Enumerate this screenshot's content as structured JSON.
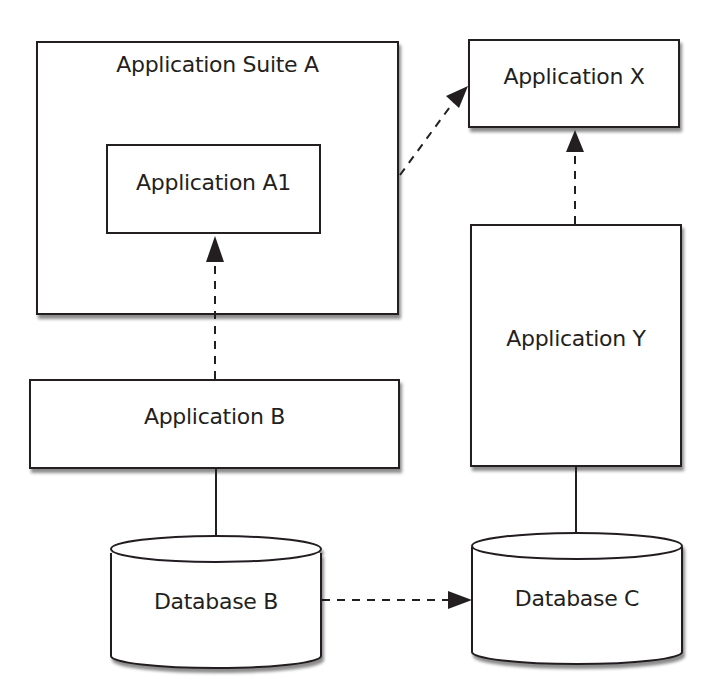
{
  "diagram": {
    "nodes": {
      "suite_a": {
        "label": "Application Suite A",
        "type": "container"
      },
      "app_a1": {
        "label": "Application A1",
        "type": "application"
      },
      "app_x": {
        "label": "Application X",
        "type": "application"
      },
      "app_y": {
        "label": "Application Y",
        "type": "application"
      },
      "app_b": {
        "label": "Application B",
        "type": "application"
      },
      "db_b": {
        "label": "Database B",
        "type": "database"
      },
      "db_c": {
        "label": "Database C",
        "type": "database"
      }
    },
    "edges": [
      {
        "from": "Application B",
        "to": "Application A1",
        "style": "dashed",
        "arrow": true
      },
      {
        "from": "Application Suite A",
        "to": "Application X",
        "style": "dashed",
        "arrow": true
      },
      {
        "from": "Application Y",
        "to": "Application X",
        "style": "dashed",
        "arrow": true
      },
      {
        "from": "Database B",
        "to": "Database C",
        "style": "dashed",
        "arrow": true
      },
      {
        "from": "Application B",
        "to": "Database B",
        "style": "solid",
        "arrow": false
      },
      {
        "from": "Application Y",
        "to": "Database C",
        "style": "solid",
        "arrow": false
      }
    ],
    "colors": {
      "stroke": "#231f20",
      "fill": "#ffffff"
    }
  }
}
